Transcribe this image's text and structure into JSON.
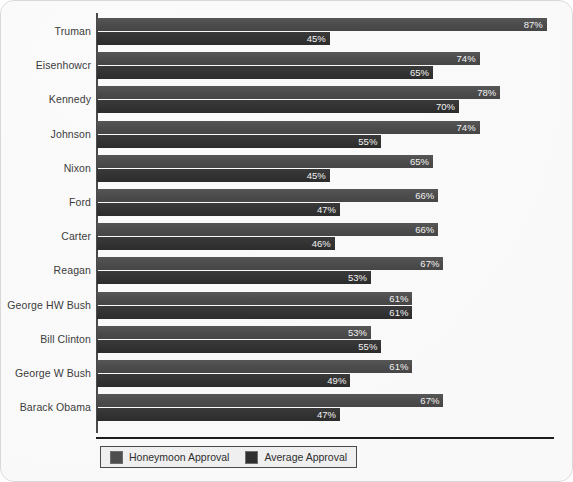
{
  "chart_data": {
    "type": "bar",
    "orientation": "horizontal",
    "title": "",
    "xlabel": "",
    "ylabel": "",
    "xlim": [
      0,
      100
    ],
    "grid": false,
    "legend_position": "bottom-left",
    "categories": [
      "Truman",
      "Eisenhowcr",
      "Kennedy",
      "Johnson",
      "Nixon",
      "Ford",
      "Carter",
      "Reagan",
      "George HW Bush",
      "Bill Clinton",
      "George W Bush",
      "Barack Obama"
    ],
    "series": [
      {
        "name": "Honeymoon Approval",
        "color": "#4e4e4e",
        "values": [
          87,
          74,
          78,
          74,
          65,
          66,
          66,
          67,
          61,
          53,
          61,
          67
        ],
        "labels": [
          "87%",
          "74%",
          "78%",
          "74%",
          "65%",
          "66%",
          "66%",
          "67%",
          "61%",
          "53%",
          "61%",
          "67%"
        ]
      },
      {
        "name": "Average Approval",
        "color": "#2f2f2f",
        "values": [
          45,
          65,
          70,
          55,
          45,
          47,
          46,
          53,
          61,
          55,
          49,
          47
        ],
        "labels": [
          "45%",
          "65%",
          "70%",
          "55%",
          "45%",
          "47%",
          "46%",
          "53%",
          "61%",
          "55%",
          "49%",
          "47%"
        ]
      }
    ]
  },
  "legend": {
    "items": [
      {
        "label": "Honeymoon Approval",
        "swatch": "honeymoon"
      },
      {
        "label": "Average Approval",
        "swatch": "average"
      }
    ]
  }
}
